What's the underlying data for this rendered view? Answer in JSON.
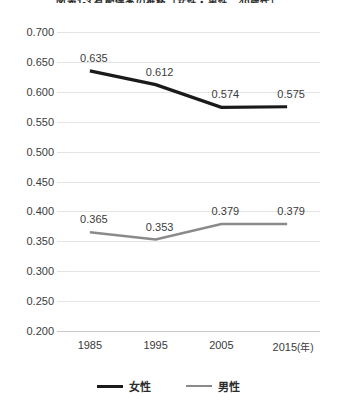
{
  "chart_data": {
    "type": "line",
    "title": "図表1-3 有配偶率の推移（女性・男性、40歳代）",
    "xlabel": "",
    "ylabel": "",
    "x": [
      "1985",
      "1995",
      "2005",
      "2015"
    ],
    "x_unit": "(年)",
    "categories": [
      "1985",
      "1995",
      "2005",
      "2015"
    ],
    "ylim": [
      0.2,
      0.7
    ],
    "ytick_step": 0.05,
    "ytick_labels": [
      "0.700",
      "0.650",
      "0.600",
      "0.550",
      "0.500",
      "0.450",
      "0.400",
      "0.350",
      "0.300",
      "0.250",
      "0.200"
    ],
    "ytick_values": [
      0.7,
      0.65,
      0.6,
      0.55,
      0.5,
      0.45,
      0.4,
      0.35,
      0.3,
      0.25,
      0.2
    ],
    "grid": true,
    "legend_position": "bottom",
    "series": [
      {
        "name": "女性",
        "color": "#1a1a1a",
        "values": [
          0.635,
          0.612,
          0.574,
          0.575
        ],
        "labels": [
          "0.635",
          "0.612",
          "0.574",
          "0.575"
        ]
      },
      {
        "name": "男性",
        "color": "#8a8a8a",
        "values": [
          0.365,
          0.353,
          0.379,
          0.379
        ],
        "labels": [
          "0.365",
          "0.353",
          "0.379",
          "0.379"
        ]
      }
    ]
  },
  "axis": {
    "y_labels": [
      "0.700",
      "0.650",
      "0.600",
      "0.550",
      "0.500",
      "0.450",
      "0.400",
      "0.350",
      "0.300",
      "0.250",
      "0.200"
    ],
    "x_labels": [
      "1985",
      "1995",
      "2005",
      "2015"
    ],
    "x_unit": "(年)"
  },
  "legend": {
    "items": [
      {
        "label": "女性",
        "color": "#1a1a1a"
      },
      {
        "label": "男性",
        "color": "#8a8a8a"
      }
    ]
  }
}
